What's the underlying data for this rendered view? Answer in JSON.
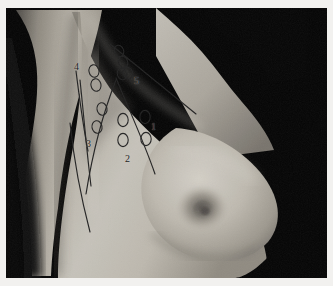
{
  "figure": {
    "kind": "clinical-photograph",
    "modality": "grayscale photograph",
    "overlay_description": "hand-drawn ink overlay marking axillary lymph node levels",
    "frame_color": "#f2f1ef",
    "background_color": "#000000",
    "ink_color": "#1f1f1f",
    "skin_highlight": "#cfcbc2",
    "skin_midtone": "#a9a49a",
    "skin_shadow": "#6d6963"
  },
  "labels": [
    {
      "id": "level-1",
      "text": "1",
      "x": 145,
      "y": 114,
      "nodes": 2
    },
    {
      "id": "level-2",
      "text": "2",
      "x": 119,
      "y": 146,
      "nodes": 2
    },
    {
      "id": "level-3",
      "text": "3",
      "x": 80,
      "y": 131,
      "nodes": 2
    },
    {
      "id": "level-4",
      "text": "4",
      "x": 68,
      "y": 54,
      "nodes": 2
    },
    {
      "id": "level-5",
      "text": "5",
      "x": 128,
      "y": 68,
      "nodes": 4
    }
  ],
  "nodes": [
    {
      "group": "level-4",
      "cx": 88,
      "cy": 63,
      "rx": 5.0,
      "ry": 6.3,
      "rot": -12
    },
    {
      "group": "level-4",
      "cx": 90,
      "cy": 77,
      "rx": 5.0,
      "ry": 6.3,
      "rot": -12
    },
    {
      "group": "level-5",
      "cx": 113,
      "cy": 43,
      "rx": 4.6,
      "ry": 5.8,
      "rot": -20
    },
    {
      "group": "level-5",
      "cx": 117,
      "cy": 54,
      "rx": 4.6,
      "ry": 5.8,
      "rot": -20
    },
    {
      "group": "level-5",
      "cx": 116,
      "cy": 66,
      "rx": 4.6,
      "ry": 5.8,
      "rot": -20
    },
    {
      "group": "level-5",
      "cx": 122,
      "cy": 65,
      "rx": 4.6,
      "ry": 5.8,
      "rot": -20
    },
    {
      "group": "level-3",
      "cx": 96,
      "cy": 101,
      "rx": 5.0,
      "ry": 6.3,
      "rot": -10
    },
    {
      "group": "level-3",
      "cx": 91,
      "cy": 119,
      "rx": 5.0,
      "ry": 6.3,
      "rot": -10
    },
    {
      "group": "level-2",
      "cx": 117,
      "cy": 112,
      "rx": 5.2,
      "ry": 6.6,
      "rot": 0
    },
    {
      "group": "level-2",
      "cx": 117,
      "cy": 132,
      "rx": 5.2,
      "ry": 6.6,
      "rot": 0
    },
    {
      "group": "level-1",
      "cx": 139,
      "cy": 109,
      "rx": 5.2,
      "ry": 6.6,
      "rot": 0
    },
    {
      "group": "level-1",
      "cx": 140,
      "cy": 131,
      "rx": 5.2,
      "ry": 6.6,
      "rot": 0
    }
  ],
  "lines": [
    {
      "id": "clavicle-line",
      "d": "M 104 36 L 190 106"
    },
    {
      "id": "pectoral-border-line",
      "d": "M 110 70 C 124 104, 138 134, 149 166"
    },
    {
      "id": "medial-axillary-line",
      "d": "M 110 72 C 99 100, 88 136, 80 186"
    },
    {
      "id": "outer-arc-line",
      "d": "M 70 63 C 73 86, 76 112, 82 143"
    },
    {
      "id": "inner-arc-line",
      "d": "M 74 72 C 78 110, 81 146, 85 178"
    },
    {
      "id": "lateral-chest-line",
      "d": "M 64 115 C 68 152, 74 186, 84 224"
    }
  ]
}
